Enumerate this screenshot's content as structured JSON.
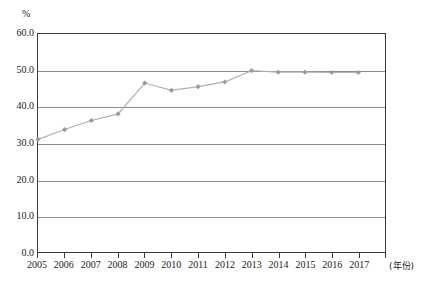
{
  "chart_data": {
    "type": "line",
    "title": "",
    "subtitle": "",
    "unit_label": "%",
    "xlabel": "(年份)",
    "ylabel": "%",
    "categories": [
      "2005",
      "2006",
      "2007",
      "2008",
      "2009",
      "2010",
      "2011",
      "2012",
      "2013",
      "2014",
      "2015",
      "2016",
      "2017"
    ],
    "x": [
      2005,
      2006,
      2007,
      2008,
      2009,
      2010,
      2011,
      2012,
      2013,
      2014,
      2015,
      2016,
      2017
    ],
    "values": [
      31.0,
      33.7,
      36.2,
      38.0,
      46.5,
      44.5,
      45.5,
      46.8,
      49.9,
      49.5,
      49.5,
      49.4,
      49.4
    ],
    "series": [
      {
        "name": "",
        "values": [
          31.0,
          33.7,
          36.2,
          38.0,
          46.5,
          44.5,
          45.5,
          46.8,
          49.9,
          49.5,
          49.5,
          49.4,
          49.4
        ]
      }
    ],
    "ylim": [
      0.0,
      60.0
    ],
    "ytick_step": 10.0,
    "ytick_labels": [
      "60.0",
      "50.0",
      "40.0",
      "30.0",
      "20.0",
      "10.0",
      "0.0"
    ],
    "ytick_values": [
      60.0,
      50.0,
      40.0,
      30.0,
      20.0,
      10.0,
      0.0
    ],
    "xtick_labels": [
      "2005",
      "2006",
      "2007",
      "2008",
      "2009",
      "2010",
      "2011",
      "2012",
      "2013",
      "2014",
      "2015",
      "2016",
      "2017"
    ],
    "grid": true,
    "grid_axis": "y",
    "legend": "none",
    "marker": "diamond",
    "line_color": "#b0b0b0",
    "marker_color": "#9b9b9b",
    "grid_color": "#8d8d8d",
    "axis_color": "#3a3a3a"
  }
}
